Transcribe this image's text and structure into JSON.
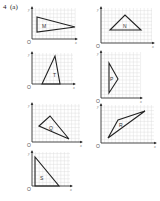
{
  "question": {
    "number": "4",
    "part": "(a)",
    "label": "4  (a)"
  },
  "axes": {
    "x_label": "x",
    "y_label": "y",
    "origin_label": "O"
  },
  "panels": [
    {
      "id": "M",
      "shape_label": "M",
      "left": 28,
      "top": 6,
      "w": 50,
      "h": 36,
      "origin": [
        4,
        33
      ],
      "points": "9,11 47,21 9,26",
      "text_pos": [
        14,
        22
      ]
    },
    {
      "id": "N",
      "shape_label": "N",
      "left": 97,
      "top": 6,
      "w": 58,
      "h": 40,
      "origin": [
        4,
        37
      ],
      "points": "13,24 28,9 44,24",
      "text_pos": [
        26,
        22
      ]
    },
    {
      "id": "T",
      "shape_label": "T",
      "left": 28,
      "top": 51,
      "w": 48,
      "h": 36,
      "origin": [
        4,
        33
      ],
      "points": "14,33 27,5 32,33",
      "text_pos": [
        25,
        26
      ]
    },
    {
      "id": "P",
      "shape_label": "P",
      "left": 97,
      "top": 50,
      "w": 46,
      "h": 51,
      "origin": [
        4,
        48
      ],
      "points": "12,13 21,29 12,43",
      "text_pos": [
        13,
        31
      ]
    },
    {
      "id": "Q",
      "shape_label": "Q",
      "left": 28,
      "top": 102,
      "w": 55,
      "h": 43,
      "origin": [
        4,
        40
      ],
      "points": "11,24 22,14 41,37",
      "text_pos": [
        21,
        28
      ]
    },
    {
      "id": "R",
      "shape_label": "R",
      "left": 97,
      "top": 103,
      "w": 60,
      "h": 43,
      "origin": [
        4,
        40
      ],
      "points": "11,35 21,17 48,8",
      "text_pos": [
        22,
        24
      ]
    },
    {
      "id": "S",
      "shape_label": "S",
      "left": 28,
      "top": 150,
      "w": 45,
      "h": 39,
      "origin": [
        4,
        36
      ],
      "points": "7,7 7,36 31,36",
      "text_pos": [
        12,
        30
      ]
    }
  ]
}
